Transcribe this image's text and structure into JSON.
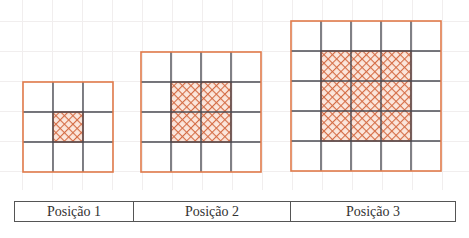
{
  "colors": {
    "outline": "#e07a4a",
    "inner_line": "#4a4a52",
    "hatch": "#d46c45",
    "background_grid": "#f1eeee"
  },
  "figures": [
    {
      "label": "Posição 1",
      "grid_size": 3,
      "shaded_size": 1,
      "shaded_cells": 1
    },
    {
      "label": "Posição 2",
      "grid_size": 4,
      "shaded_size": 2,
      "shaded_cells": 4
    },
    {
      "label": "Posição 3",
      "grid_size": 5,
      "shaded_size": 3,
      "shaded_cells": 9
    }
  ],
  "table": {
    "cells": [
      "Posição 1",
      "Posição 2",
      "Posição 3"
    ]
  }
}
